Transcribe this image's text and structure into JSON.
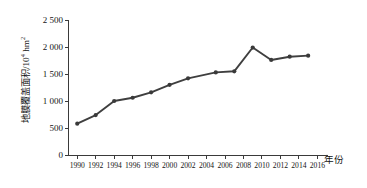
{
  "chart_data": {
    "type": "line",
    "title": "",
    "subtitle": "",
    "xlabel": "年份",
    "ylabel": "地膜覆盖面积/10⁴ hm²",
    "ylabel_base": "地膜覆盖面积/10",
    "ylabel_exponent": "4",
    "ylabel_unit": " hm",
    "ylabel_unit_exponent": "2",
    "grid": false,
    "legend": "none",
    "xlim": [
      1989,
      2016.5
    ],
    "ylim": [
      0,
      2500
    ],
    "ytick_labels": [
      "0",
      "500",
      "1 000",
      "1 500",
      "2 000",
      "2 500"
    ],
    "ytick_values": [
      0,
      500,
      1000,
      1500,
      2000,
      2500
    ],
    "xtick_labels": [
      "1990",
      "1992",
      "1994",
      "1996",
      "1998",
      "2000",
      "2002",
      "2004",
      "2006",
      "2008",
      "2010",
      "2012",
      "2014",
      "2016"
    ],
    "xtick_values": [
      1990,
      1992,
      1994,
      1996,
      1998,
      2000,
      2002,
      2004,
      2006,
      2008,
      2010,
      2012,
      2014,
      2016
    ],
    "x": [
      1990,
      1992,
      1994,
      1996,
      1998,
      2000,
      2002,
      2005,
      2007,
      2009,
      2011,
      2013,
      2015
    ],
    "values": [
      580,
      740,
      1000,
      1060,
      1160,
      1300,
      1420,
      1530,
      1550,
      1990,
      1760,
      1820,
      1840
    ],
    "series": [
      {
        "name": "地膜覆盖面积",
        "x": [
          1990,
          1992,
          1994,
          1996,
          1998,
          2000,
          2002,
          2005,
          2007,
          2009,
          2011,
          2013,
          2015
        ],
        "values": [
          580,
          740,
          1000,
          1060,
          1160,
          1300,
          1420,
          1530,
          1550,
          1990,
          1760,
          1820,
          1840
        ],
        "color": "#3a3a3a",
        "marker": "circle"
      }
    ],
    "annotations": []
  },
  "style": {
    "line_color": "#3f3f3f",
    "axis_color": "#3a3a3a",
    "background": "#ffffff",
    "text_color": "#141414"
  }
}
